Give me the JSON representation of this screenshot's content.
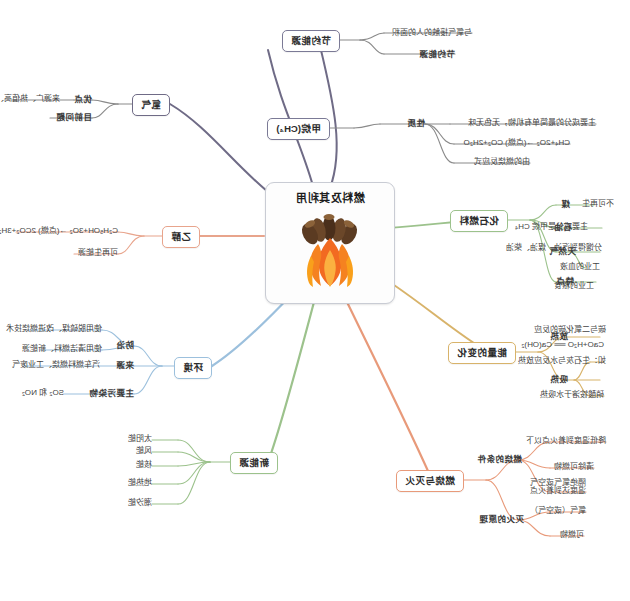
{
  "diagram": {
    "type": "mind-map",
    "title": "燃料及其利用",
    "orientation": "horizontally-mirrored",
    "central": {
      "label": "燃料及其利用",
      "icon": "campfire-icon"
    },
    "colors": {
      "hydrogen": "#6f6b86",
      "ethanol": "#e8a48c",
      "pollution": "#9cc0dd",
      "new_energy": "#9cc28c",
      "combustion": "#e89a7a",
      "energy_change": "#d8b36a",
      "fossil_fuel": "#9cc28c",
      "methane": "#7b7a96",
      "save_fuel": "#7b7a96",
      "card_border": "#c9ccd4",
      "text": "#2b2b2b"
    },
    "branches": [
      {
        "id": "save-fuel",
        "label": "节约能源",
        "children": [
          {
            "label": "节约能源",
            "children": [
              {
                "label": "与氧气接触的人的面积"
              }
            ]
          }
        ]
      },
      {
        "id": "methane",
        "label": "甲烷(CH₄)",
        "children": [
          {
            "label": "性质",
            "children": [
              {
                "label": "主要成分的最简单有机物，无色无味"
              },
              {
                "label": "CH₄+2O₂ →(点燃) CO₂+2H₂O"
              },
              {
                "label": "由的燃烧反应式"
              }
            ]
          }
        ]
      },
      {
        "id": "fossil-fuel",
        "label": "化石燃料",
        "children": [
          {
            "label": "煤",
            "children": [
              {
                "label": "工业的粮食"
              }
            ]
          },
          {
            "label": "石油",
            "children": [
              {
                "label": "工业的血液"
              },
              {
                "label": "分馏得到汽油、煤油、柴油"
              }
            ]
          },
          {
            "label": "天然气",
            "children": [
              {
                "label": "主要成分是甲烷 CH₄"
              }
            ]
          },
          {
            "label": "特点",
            "children": [
              {
                "label": "不可再生"
              }
            ]
          }
        ]
      },
      {
        "id": "energy-change",
        "label": "能量的变化",
        "children": [
          {
            "label": "放热",
            "children": [
              {
                "label": "如：生石灰与水反应放热"
              },
              {
                "label": "CaO+H₂O ══ Ca(OH)₂"
              }
            ]
          },
          {
            "label": "吸热",
            "children": [
              {
                "label": "硝酸铵溶于水吸热"
              },
              {
                "label": "碳与二氧化碳的反应"
              }
            ]
          }
        ]
      },
      {
        "id": "combustion",
        "label": "燃烧与灭火",
        "children": [
          {
            "label": "燃烧的条件",
            "children": [
              {
                "label": "可燃物"
              },
              {
                "label": "氧气（或空气）"
              },
              {
                "label": "温度达到着火点"
              }
            ]
          },
          {
            "label": "灭火的原理",
            "children": [
              {
                "label": "清除可燃物"
              },
              {
                "label": "隔绝氧气或空气"
              },
              {
                "label": "降低温度到着火点以下"
              }
            ]
          }
        ]
      },
      {
        "id": "new-energy",
        "label": "新能源",
        "children": [
          {
            "label": "太阳能"
          },
          {
            "label": "风能"
          },
          {
            "label": "核能"
          },
          {
            "label": "地热能"
          },
          {
            "label": "潮汐能"
          }
        ]
      },
      {
        "id": "pollution",
        "label": "环境",
        "children": [
          {
            "label": "主要污染物",
            "children": [
              {
                "label": "SO₂ 和 NO₂"
              }
            ]
          },
          {
            "label": "来源",
            "children": [
              {
                "label": "汽车燃料燃烧、工业废气"
              }
            ]
          },
          {
            "label": "防治",
            "children": [
              {
                "label": "使用脱硫煤、改进燃烧技术"
              },
              {
                "label": "使用清洁燃料、新能源"
              }
            ]
          }
        ]
      },
      {
        "id": "ethanol",
        "label": "乙醇",
        "children": [
          {
            "label": "可再生能源",
            "children": [
              {
                "label": "C₂H₅OH+3O₂ →(点燃) 2CO₂+3H₂O"
              }
            ]
          }
        ]
      },
      {
        "id": "hydrogen",
        "label": "氢气",
        "children": [
          {
            "label": "优点",
            "children": [
              {
                "label": "来源广、热值高、无污染"
              }
            ]
          },
          {
            "label": "目前问题",
            "children": []
          }
        ]
      }
    ]
  }
}
